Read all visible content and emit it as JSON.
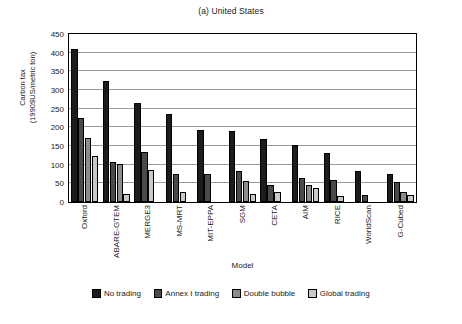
{
  "chart_data": {
    "type": "bar",
    "title": "(a) United States",
    "xlabel": "Model",
    "ylabel": "Carbon tax (1990$US/metric ton)",
    "ylabel_line1": "Carbon tax",
    "ylabel_line2": "(1990$US/metric ton)",
    "ylim": [
      0,
      450
    ],
    "ytick_step": 50,
    "yticks": [
      0,
      50,
      100,
      150,
      200,
      250,
      300,
      350,
      400,
      450
    ],
    "grid": true,
    "legend_position": "bottom",
    "categories": [
      "Oxford",
      "ABARE-GTEM",
      "MERGE3",
      "MS-MRT",
      "MIT-EPPA",
      "SGM",
      "CETA",
      "AIM",
      "RICE",
      "WorldScan",
      "G-Cubed"
    ],
    "series": [
      {
        "name": "No trading",
        "color": "#1c1c1c",
        "values": [
          410,
          323,
          265,
          237,
          194,
          189,
          168,
          152,
          131,
          84,
          75
        ]
      },
      {
        "name": "Annex I trading",
        "color": "#4a4a4a",
        "values": [
          225,
          106,
          135,
          76,
          75,
          83,
          46,
          65,
          60,
          19,
          53
        ]
      },
      {
        "name": "Double bubble",
        "color": "#8c8c8c",
        "values": [
          172,
          101,
          null,
          null,
          null,
          57,
          null,
          46,
          null,
          null,
          27
        ]
      },
      {
        "name": "Global trading",
        "color": "#c9c9c9",
        "values": [
          123,
          22,
          86,
          26,
          null,
          21,
          26,
          37,
          17,
          null,
          20
        ]
      }
    ]
  },
  "legend": {
    "items": [
      {
        "label": "No trading",
        "color": "#1c1c1c"
      },
      {
        "label": "Annex I trading",
        "color": "#4a4a4a"
      },
      {
        "label": "Double bubble",
        "color": "#8c8c8c"
      },
      {
        "label": "Global trading",
        "color": "#c9c9c9"
      }
    ]
  }
}
